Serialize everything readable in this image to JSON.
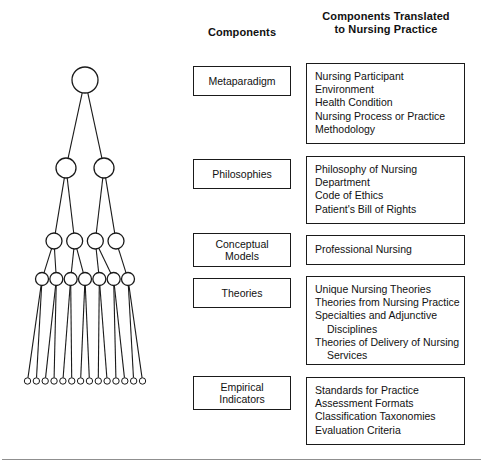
{
  "headers": {
    "components": "Components",
    "translated_line1": "Components Translated",
    "translated_line2": "to Nursing Practice"
  },
  "rows": [
    {
      "component": "Metaparadigm",
      "component_lines": [
        "Metaparadigm"
      ],
      "translated": [
        "Nursing Participant",
        "Environment",
        "Health Condition",
        "Nursing Process or Practice",
        "Methodology"
      ]
    },
    {
      "component": "Philosophies",
      "component_lines": [
        "Philosophies"
      ],
      "translated": [
        "Philosophy of Nursing",
        "Department",
        "Code of Ethics",
        "Patient's Bill of Rights"
      ]
    },
    {
      "component": "Conceptual Models",
      "component_lines": [
        "Conceptual",
        "Models"
      ],
      "translated": [
        "Professional Nursing"
      ]
    },
    {
      "component": "Theories",
      "component_lines": [
        "Theories"
      ],
      "translated": [
        "Unique Nursing Theories",
        "Theories from Nursing Practice",
        "Specialties and Adjunctive",
        "Disciplines",
        "Theories of Delivery of Nursing",
        "Services"
      ],
      "translated_indent": [
        false,
        false,
        false,
        true,
        false,
        true
      ]
    },
    {
      "component": "Empirical Indicators",
      "component_lines": [
        "Empirical",
        "Indicators"
      ],
      "translated": [
        "Standards for Practice",
        "Assessment Formats",
        "Classification Taxonomies",
        "Evaluation Criteria"
      ]
    }
  ],
  "tree": {
    "description": "Hierarchical tree of nodes widening from one top node to fourteen bottom nodes",
    "levels": [
      {
        "name": "metaparadigm-level",
        "count": 1,
        "radius": 13
      },
      {
        "name": "philosophies-level",
        "count": 2,
        "radius": 10
      },
      {
        "name": "conceptual-models-level",
        "count": 4,
        "radius": 8
      },
      {
        "name": "theories-level",
        "count": 7,
        "radius": 6.5
      },
      {
        "name": "empirical-indicators-level",
        "count": 14,
        "radius": 3.2
      }
    ],
    "line_color": "#1a1a1a",
    "node_fill": "#ffffff"
  },
  "colors": {
    "border": "#1a1a1a",
    "text": "#111111",
    "rule": "#8f8f8f",
    "background": "#ffffff"
  }
}
